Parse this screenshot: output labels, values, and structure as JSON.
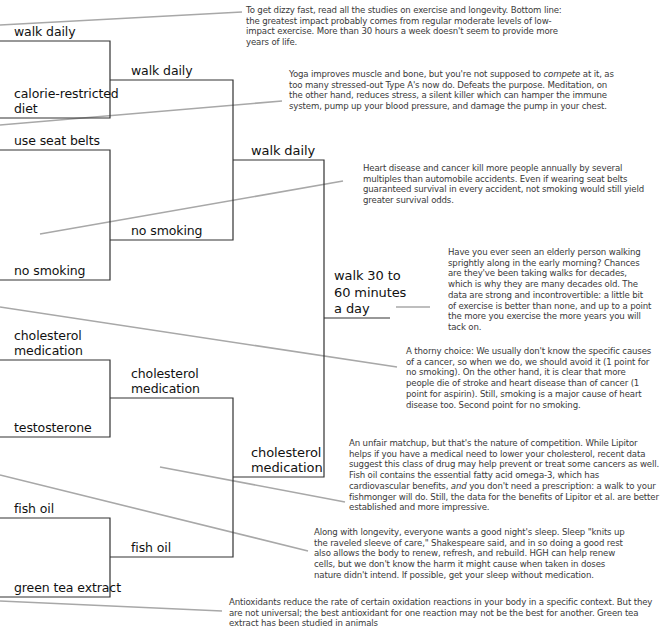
{
  "colors": {
    "bracket_line": "#333333",
    "leader_line": "#a8a8a8",
    "label_text": "#111111",
    "note_text": "#3a3a3a",
    "background": "#ffffff"
  },
  "bracket": {
    "round1": [
      {
        "id": "r1-1",
        "label": "walk daily"
      },
      {
        "id": "r1-2",
        "label": "calorie-restricted diet",
        "line1": "calorie-restricted",
        "line2": "diet"
      },
      {
        "id": "r1-3",
        "label": "use seat belts"
      },
      {
        "id": "r1-4",
        "label": "no smoking"
      },
      {
        "id": "r1-5",
        "label": "cholesterol medication",
        "line1": "cholesterol",
        "line2": "medication"
      },
      {
        "id": "r1-6",
        "label": "testosterone"
      },
      {
        "id": "r1-7",
        "label": "fish oil"
      },
      {
        "id": "r1-8",
        "label": "green tea extract"
      }
    ],
    "round2": [
      {
        "id": "r2-1",
        "label": "walk daily"
      },
      {
        "id": "r2-2",
        "label": "no smoking"
      },
      {
        "id": "r2-3",
        "label": "cholesterol medication",
        "line1": "cholesterol",
        "line2": "medication"
      },
      {
        "id": "r2-4",
        "label": "fish oil"
      }
    ],
    "round3": [
      {
        "id": "r3-1",
        "label": "walk daily"
      },
      {
        "id": "r3-2",
        "label": "cholesterol medication",
        "line1": "cholesterol",
        "line2": "medication"
      }
    ],
    "winner": {
      "label": "walk 30 to 60 minutes a day",
      "line1": "walk 30 to",
      "line2": "60 minutes",
      "line3": "a day"
    }
  },
  "notes": [
    {
      "id": "note-exercise",
      "text": "To get dizzy fast, read all the studies on exercise and longevity. Bottom line: the greatest impact probably comes from regular moderate levels of low-impact exercise. More than 30 hours a week doesn't seem to provide more years of life."
    },
    {
      "id": "note-yoga",
      "pre": "Yoga improves muscle and bone, but you're not supposed to ",
      "em": "compete",
      "post": " at it, as too many stressed-out Type A's now do. Defeats the purpose. Meditation, on the other hand, reduces stress, a silent killer which can hamper the immune system, pump up your blood pressure, and damage the pump in your chest."
    },
    {
      "id": "note-seatbelts",
      "text": "Heart disease and cancer kill more people annually by several multiples than automobile accidents. Even if wearing seat belts guaranteed survival in every accident, not smoking would still yield greater survival odds."
    },
    {
      "id": "note-walking",
      "text": "Have you ever seen an elderly person walking sprightly along in the early morning? Chances are they've been taking walks for decades, which is why they are many decades old. The data are strong and incontrovertible: a little bit of exercise is better than none, and up to a point the more you exercise the more years you will tack on."
    },
    {
      "id": "note-smoking",
      "text": "A thorny choice: We usually don't know the specific causes of a cancer, so when we do, we should avoid it (1 point for no smoking). On the other hand, it is clear that more people die of stroke and heart disease than of cancer (1 point for aspirin). Still, smoking is a major cause of heart disease too. Second point for no smoking."
    },
    {
      "id": "note-lipitor",
      "pre": "An unfair matchup, but that's the nature of competition. While Lipitor helps if you have a medical need to lower your cholesterol, recent data suggest this class of drug may help prevent or treat some cancers as well. Fish oil contains the essential fatty acid omega-3, which has cardiovascular benefits, ",
      "em": "and",
      "post": " you don't need a prescription: a walk to your fishmonger will do. Still, the data for the benefits of Lipitor et al. are better established and more impressive."
    },
    {
      "id": "note-sleep",
      "text": "Along with longevity, everyone wants a good night's sleep. Sleep \"knits up the raveled sleeve of care,\" Shakespeare said, and in so doing a good rest also allows the body to renew, refresh, and rebuild. HGH can help renew cells, but we don't know the harm it might cause when taken in doses nature didn't intend. If possible, get your sleep without medication."
    },
    {
      "id": "note-antioxidants",
      "text": "Antioxidants reduce the rate of certain oxidation reactions in your body in a specific context. But they are not universal; the best antioxidant for one reaction may not be the best for another. Green tea extract has been studied in animals"
    }
  ]
}
